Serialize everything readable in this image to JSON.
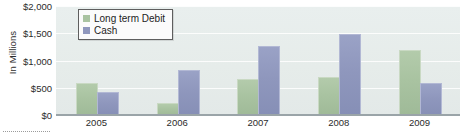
{
  "chart_data": {
    "type": "bar",
    "title": "",
    "subtitle": "",
    "xlabel": "",
    "ylabel": "In Millions",
    "categories": [
      "2005",
      "2006",
      "2007",
      "2008",
      "2009"
    ],
    "series": [
      {
        "name": "Long term Debit",
        "color": "#a9c3a1",
        "values": [
          570,
          195,
          650,
          680,
          1180
        ]
      },
      {
        "name": "Cash",
        "color": "#8f97bd",
        "values": [
          395,
          800,
          1250,
          1475,
          575
        ]
      }
    ],
    "ylim": [
      0,
      2000
    ],
    "yticks": [
      0,
      500,
      1000,
      1500,
      2000
    ],
    "ytick_labels": [
      "$0",
      "$500",
      "$1,000",
      "$1,500",
      "$2,000"
    ],
    "grid": true,
    "legend_position": "top-left",
    "plot_background": "#e8eeec",
    "axis_color": "#9aa4a8"
  },
  "legend": {
    "entries": [
      {
        "label": "Long term Debit",
        "swatch": "debt"
      },
      {
        "label": "Cash",
        "swatch": "cash"
      }
    ]
  },
  "axes": {
    "y_title": "In Millions"
  }
}
